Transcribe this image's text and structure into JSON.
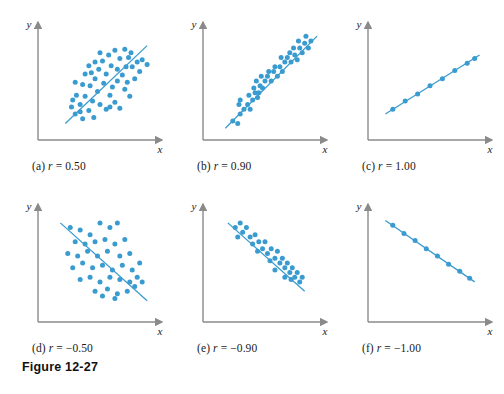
{
  "figure": {
    "caption": "Figure 12-27",
    "colors": {
      "point": "#3a9bd0",
      "line": "#3a9bd0",
      "axis": "#8a8a8a",
      "text": "#1a1a1a",
      "background": "#ffffff"
    },
    "axis_labels": {
      "x": "x",
      "y": "y"
    }
  },
  "chart_data": [
    {
      "type": "scatter",
      "id": "panel-a",
      "title": "(a) r = 0.50",
      "label_prefix": "(a)",
      "r_symbol": "r",
      "r_value": "0.50",
      "xlabel": "x",
      "ylabel": "y",
      "xlim": [
        0,
        100
      ],
      "ylim": [
        0,
        100
      ],
      "grid": false,
      "legend": "none",
      "trendline": {
        "x0": 22,
        "y0": 14,
        "x1": 88,
        "y1": 80
      },
      "points": [
        [
          30,
          22
        ],
        [
          36,
          18
        ],
        [
          27,
          28
        ],
        [
          34,
          30
        ],
        [
          41,
          25
        ],
        [
          45,
          19
        ],
        [
          38,
          37
        ],
        [
          31,
          38
        ],
        [
          44,
          33
        ],
        [
          50,
          30
        ],
        [
          48,
          41
        ],
        [
          55,
          26
        ],
        [
          42,
          46
        ],
        [
          36,
          47
        ],
        [
          30,
          49
        ],
        [
          46,
          52
        ],
        [
          53,
          48
        ],
        [
          58,
          38
        ],
        [
          62,
          32
        ],
        [
          66,
          27
        ],
        [
          60,
          45
        ],
        [
          55,
          56
        ],
        [
          49,
          60
        ],
        [
          43,
          57
        ],
        [
          38,
          56
        ],
        [
          64,
          50
        ],
        [
          70,
          43
        ],
        [
          68,
          55
        ],
        [
          74,
          37
        ],
        [
          72,
          49
        ],
        [
          59,
          63
        ],
        [
          52,
          67
        ],
        [
          46,
          66
        ],
        [
          41,
          63
        ],
        [
          64,
          60
        ],
        [
          71,
          62
        ],
        [
          78,
          52
        ],
        [
          76,
          62
        ],
        [
          57,
          72
        ],
        [
          50,
          74
        ],
        [
          66,
          69
        ],
        [
          73,
          70
        ],
        [
          82,
          58
        ],
        [
          80,
          66
        ],
        [
          62,
          76
        ],
        [
          70,
          77
        ],
        [
          84,
          68
        ],
        [
          88,
          64
        ],
        [
          75,
          74
        ],
        [
          58,
          28
        ],
        [
          34,
          24
        ],
        [
          28,
          34
        ]
      ]
    },
    {
      "type": "scatter",
      "id": "panel-b",
      "title": "(b) r = 0.90",
      "label_prefix": "(b)",
      "r_symbol": "r",
      "r_value": "0.90",
      "xlabel": "x",
      "ylabel": "y",
      "xlim": [
        0,
        100
      ],
      "ylim": [
        0,
        100
      ],
      "grid": false,
      "legend": "none",
      "trendline": {
        "x0": 18,
        "y0": 10,
        "x1": 92,
        "y1": 88
      },
      "points": [
        [
          24,
          16
        ],
        [
          28,
          14
        ],
        [
          30,
          22
        ],
        [
          33,
          26
        ],
        [
          29,
          30
        ],
        [
          36,
          30
        ],
        [
          38,
          26
        ],
        [
          40,
          34
        ],
        [
          37,
          38
        ],
        [
          42,
          40
        ],
        [
          44,
          36
        ],
        [
          41,
          44
        ],
        [
          46,
          46
        ],
        [
          43,
          50
        ],
        [
          48,
          44
        ],
        [
          50,
          50
        ],
        [
          47,
          54
        ],
        [
          52,
          54
        ],
        [
          55,
          50
        ],
        [
          53,
          58
        ],
        [
          57,
          58
        ],
        [
          60,
          54
        ],
        [
          58,
          62
        ],
        [
          62,
          62
        ],
        [
          64,
          58
        ],
        [
          66,
          66
        ],
        [
          63,
          70
        ],
        [
          68,
          70
        ],
        [
          71,
          66
        ],
        [
          70,
          74
        ],
        [
          74,
          72
        ],
        [
          76,
          68
        ],
        [
          73,
          78
        ],
        [
          78,
          78
        ],
        [
          80,
          74
        ],
        [
          77,
          84
        ],
        [
          82,
          82
        ],
        [
          85,
          78
        ],
        [
          83,
          88
        ],
        [
          87,
          84
        ],
        [
          30,
          34
        ],
        [
          45,
          40
        ]
      ]
    },
    {
      "type": "scatter",
      "id": "panel-c",
      "title": "(c) r = 1.00",
      "label_prefix": "(c)",
      "r_symbol": "r",
      "r_value": "1.00",
      "xlabel": "x",
      "ylabel": "y",
      "xlim": [
        0,
        100
      ],
      "ylim": [
        0,
        100
      ],
      "grid": false,
      "legend": "none",
      "trendline": {
        "x0": 14,
        "y0": 22,
        "x1": 90,
        "y1": 72
      },
      "points": [
        [
          20,
          26
        ],
        [
          30,
          33
        ],
        [
          40,
          39
        ],
        [
          50,
          46
        ],
        [
          60,
          52
        ],
        [
          70,
          59
        ],
        [
          80,
          65
        ],
        [
          86,
          69
        ]
      ]
    },
    {
      "type": "scatter",
      "id": "panel-d",
      "title": "(d) r = -0.50",
      "label_prefix": "(d)",
      "r_symbol": "r",
      "r_value": "−0.50",
      "xlabel": "x",
      "ylabel": "y",
      "xlim": [
        0,
        100
      ],
      "ylim": [
        0,
        100
      ],
      "grid": false,
      "legend": "none",
      "trendline": {
        "x0": 18,
        "y0": 84,
        "x1": 88,
        "y1": 18
      },
      "points": [
        [
          26,
          80
        ],
        [
          34,
          78
        ],
        [
          42,
          74
        ],
        [
          50,
          84
        ],
        [
          58,
          80
        ],
        [
          64,
          84
        ],
        [
          30,
          68
        ],
        [
          38,
          66
        ],
        [
          46,
          68
        ],
        [
          54,
          70
        ],
        [
          62,
          66
        ],
        [
          70,
          70
        ],
        [
          24,
          58
        ],
        [
          32,
          56
        ],
        [
          40,
          60
        ],
        [
          48,
          56
        ],
        [
          56,
          60
        ],
        [
          66,
          56
        ],
        [
          74,
          58
        ],
        [
          28,
          46
        ],
        [
          36,
          50
        ],
        [
          44,
          46
        ],
        [
          52,
          48
        ],
        [
          60,
          44
        ],
        [
          68,
          48
        ],
        [
          76,
          44
        ],
        [
          82,
          50
        ],
        [
          34,
          36
        ],
        [
          42,
          38
        ],
        [
          50,
          34
        ],
        [
          58,
          38
        ],
        [
          66,
          36
        ],
        [
          74,
          34
        ],
        [
          80,
          38
        ],
        [
          46,
          26
        ],
        [
          56,
          28
        ],
        [
          64,
          24
        ],
        [
          72,
          26
        ],
        [
          78,
          30
        ],
        [
          84,
          34
        ],
        [
          52,
          22
        ],
        [
          62,
          20
        ]
      ]
    },
    {
      "type": "scatter",
      "id": "panel-e",
      "title": "(e) r = -0.90",
      "label_prefix": "(e)",
      "r_symbol": "r",
      "r_value": "−0.90",
      "xlabel": "x",
      "ylabel": "y",
      "xlim": [
        0,
        100
      ],
      "ylim": [
        0,
        100
      ],
      "grid": false,
      "legend": "none",
      "trendline": {
        "x0": 20,
        "y0": 84,
        "x1": 82,
        "y1": 26
      },
      "points": [
        [
          26,
          80
        ],
        [
          30,
          84
        ],
        [
          32,
          76
        ],
        [
          35,
          80
        ],
        [
          28,
          72
        ],
        [
          38,
          72
        ],
        [
          42,
          74
        ],
        [
          40,
          66
        ],
        [
          45,
          68
        ],
        [
          44,
          60
        ],
        [
          48,
          62
        ],
        [
          50,
          68
        ],
        [
          52,
          58
        ],
        [
          55,
          62
        ],
        [
          54,
          52
        ],
        [
          58,
          54
        ],
        [
          60,
          60
        ],
        [
          62,
          50
        ],
        [
          64,
          54
        ],
        [
          66,
          46
        ],
        [
          68,
          50
        ],
        [
          70,
          42
        ],
        [
          72,
          46
        ],
        [
          74,
          38
        ],
        [
          76,
          42
        ],
        [
          78,
          34
        ],
        [
          80,
          38
        ],
        [
          71,
          36
        ],
        [
          66,
          38
        ],
        [
          58,
          44
        ]
      ]
    },
    {
      "type": "scatter",
      "id": "panel-f",
      "title": "(f) r = -1.00",
      "label_prefix": "(f)",
      "r_symbol": "r",
      "r_value": "−1.00",
      "xlabel": "x",
      "ylabel": "y",
      "xlim": [
        0,
        100
      ],
      "ylim": [
        0,
        100
      ],
      "grid": false,
      "legend": "none",
      "trendline": {
        "x0": 14,
        "y0": 86,
        "x1": 86,
        "y1": 34
      },
      "points": [
        [
          20,
          82
        ],
        [
          29,
          75
        ],
        [
          38,
          69
        ],
        [
          47,
          62
        ],
        [
          56,
          56
        ],
        [
          65,
          49
        ],
        [
          74,
          43
        ],
        [
          82,
          37
        ]
      ]
    }
  ]
}
